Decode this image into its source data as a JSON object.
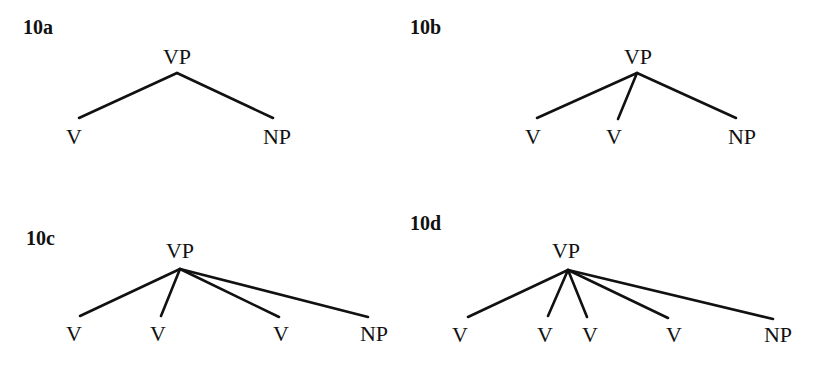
{
  "trees": [
    {
      "id": "10a",
      "label": "10a",
      "root": "VP",
      "children": [
        "V",
        "NP"
      ]
    },
    {
      "id": "10b",
      "label": "10b",
      "root": "VP",
      "children": [
        "V",
        "V",
        "NP"
      ]
    },
    {
      "id": "10c",
      "label": "10c",
      "root": "VP",
      "children": [
        "V",
        "V",
        "V",
        "NP"
      ]
    },
    {
      "id": "10d",
      "label": "10d",
      "root": "VP",
      "children": [
        "V",
        "V",
        "V",
        "V",
        "NP"
      ]
    }
  ]
}
